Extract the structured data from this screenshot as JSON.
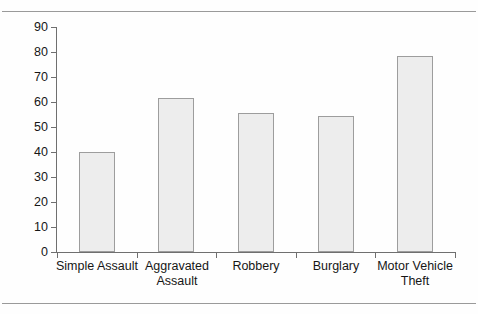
{
  "page": {
    "frame": {
      "top_rule": "horizontal-rule",
      "bottom_rule": "horizontal-rule"
    }
  },
  "chart_data": {
    "type": "bar",
    "title": "",
    "subtitle": "",
    "xlabel": "",
    "ylabel": "",
    "categories": [
      "Simple Assault",
      "Aggravated Assault",
      "Robbery",
      "Burglary",
      "Motor Vehicle Theft"
    ],
    "category_lines": [
      [
        "Simple Assault"
      ],
      [
        "Aggravated",
        "Assault"
      ],
      [
        "Robbery"
      ],
      [
        "Burglary"
      ],
      [
        "Motor Vehicle",
        "Theft"
      ]
    ],
    "values": [
      40,
      61.5,
      55.5,
      54.5,
      78.5
    ],
    "ylim": [
      0,
      90
    ],
    "yticks": [
      0,
      10,
      20,
      30,
      40,
      50,
      60,
      70,
      80,
      90
    ],
    "ytick_labels": [
      "0",
      "10",
      "20",
      "30",
      "40",
      "50",
      "60",
      "70",
      "80",
      "90"
    ],
    "grid": false,
    "legend": null,
    "bar_fill": "#ededed",
    "bar_edge": "#9d9d9d",
    "axis_color": "#6f6f6f",
    "text_color": "#161616"
  }
}
